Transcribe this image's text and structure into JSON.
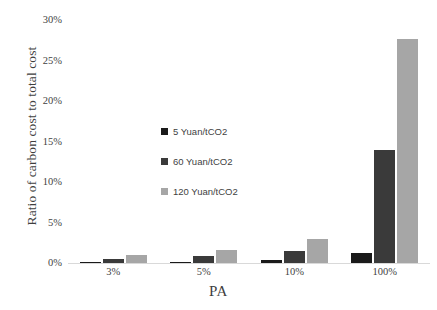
{
  "chart_data": {
    "type": "bar",
    "title": "",
    "xlabel": "PA",
    "ylabel": "Ratio of carbon cost to total cost",
    "categories": [
      "3%",
      "5%",
      "10%",
      "100%"
    ],
    "series": [
      {
        "name": "5 Yuan/tCO2",
        "color": "#1a1a1a",
        "values": [
          0.12,
          0.18,
          0.35,
          1.25
        ]
      },
      {
        "name": "60 Yuan/tCO2",
        "color": "#3a3a3a",
        "values": [
          0.55,
          0.85,
          1.45,
          13.9
        ]
      },
      {
        "name": "120 Yuan/tCO2",
        "color": "#a6a6a6",
        "values": [
          0.95,
          1.6,
          2.95,
          27.7
        ]
      }
    ],
    "ylim": [
      0,
      30
    ],
    "ytick_labels": [
      "0%",
      "5%",
      "10%",
      "15%",
      "20%",
      "25%",
      "30%"
    ],
    "ytick_values": [
      0,
      5,
      10,
      15,
      20,
      25,
      30
    ],
    "grid": false,
    "legend_position": "center-left-inside"
  },
  "axes": {
    "y_title": "Ratio of carbon cost to total cost",
    "x_title": "PA"
  },
  "legend": {
    "entries": [
      {
        "label": "5 Yuan/tCO2"
      },
      {
        "label": "60 Yuan/tCO2"
      },
      {
        "label": "120 Yuan/tCO2"
      }
    ]
  },
  "colors": {
    "series_1": "#1a1a1a",
    "series_2": "#3a3a3a",
    "series_3": "#a6a6a6",
    "axis_line": "#d9d9d9",
    "text": "#3f3f3f",
    "background": "#ffffff"
  }
}
